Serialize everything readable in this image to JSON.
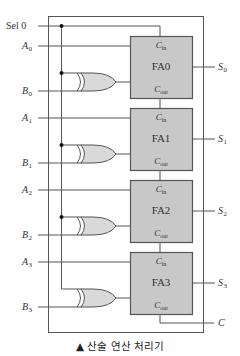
{
  "diagram": {
    "caption": "▲ 산술 연산 처리기",
    "select_input": {
      "label": "Sel",
      "value": "0"
    },
    "inputs": [
      {
        "a": "A",
        "a_sub": "0",
        "b": "B",
        "b_sub": "0"
      },
      {
        "a": "A",
        "a_sub": "1",
        "b": "B",
        "b_sub": "1"
      },
      {
        "a": "A",
        "a_sub": "2",
        "b": "B",
        "b_sub": "2"
      },
      {
        "a": "A",
        "a_sub": "3",
        "b": "B",
        "b_sub": "3"
      }
    ],
    "full_adders": [
      {
        "name": "FA0",
        "cin": "C",
        "cin_sub": "in",
        "cout": "C",
        "cout_sub": "out"
      },
      {
        "name": "FA1",
        "cin": "C",
        "cin_sub": "in",
        "cout": "C",
        "cout_sub": "out"
      },
      {
        "name": "FA2",
        "cin": "C",
        "cin_sub": "in",
        "cout": "C",
        "cout_sub": "out"
      },
      {
        "name": "FA3",
        "cin": "C",
        "cin_sub": "in",
        "cout": "C",
        "cout_sub": "out"
      }
    ],
    "outputs": [
      {
        "s": "S",
        "s_sub": "0"
      },
      {
        "s": "S",
        "s_sub": "1"
      },
      {
        "s": "S",
        "s_sub": "2"
      },
      {
        "s": "S",
        "s_sub": "3"
      }
    ],
    "carry_output": "C",
    "gate_type": "XOR",
    "colors": {
      "block_fill": "#c8c8c8",
      "block_stroke": "#555555",
      "gate_fill": "#d9d9d9",
      "wire": "#555555"
    }
  }
}
